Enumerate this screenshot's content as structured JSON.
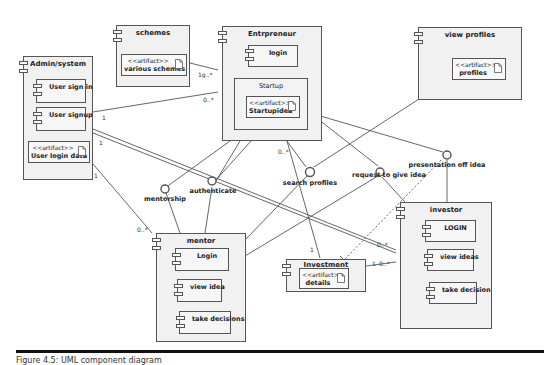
{
  "diagram": {
    "type": "UML component diagram",
    "components": {
      "admin": {
        "title": "Admin/system",
        "children": [
          {
            "kind": "component",
            "label": "User sign in"
          },
          {
            "kind": "component",
            "label": "User signup"
          },
          {
            "kind": "artifact",
            "stereotype": "<<artifact>>",
            "label": "User login data"
          }
        ]
      },
      "schemes": {
        "title": "schemes",
        "children": [
          {
            "kind": "artifact",
            "stereotype": "<<artifact>>",
            "label": "various schemes"
          }
        ]
      },
      "entrepreneur": {
        "title": "Entrpreneur",
        "children": [
          {
            "kind": "component",
            "label": "login"
          },
          {
            "kind": "container",
            "label": "Startup",
            "children": [
              {
                "kind": "artifact",
                "stereotype": "<<artifact>>",
                "label": "Startupidea"
              }
            ]
          }
        ]
      },
      "view_profiles": {
        "title": "view profiles",
        "children": [
          {
            "kind": "artifact",
            "stereotype": "<<artifact>>",
            "label": "profiles"
          }
        ]
      },
      "mentor": {
        "title": "mentor",
        "children": [
          {
            "kind": "component",
            "label": "Login"
          },
          {
            "kind": "component",
            "label": "view idea"
          },
          {
            "kind": "component",
            "label": "take decisions"
          }
        ]
      },
      "investment": {
        "title": "Investment",
        "children": [
          {
            "kind": "artifact",
            "stereotype": "<<artifact>>",
            "label": "details"
          }
        ]
      },
      "investor": {
        "title": "investor",
        "children": [
          {
            "kind": "component",
            "label": "LOGIN"
          },
          {
            "kind": "component",
            "label": "view ideas"
          },
          {
            "kind": "component",
            "label": "take decision"
          }
        ]
      }
    },
    "interfaces": [
      {
        "id": "mentorship",
        "label": "mentorship"
      },
      {
        "id": "authenticate",
        "label": "authenticate"
      },
      {
        "id": "search_profiles",
        "label": "search profiles"
      },
      {
        "id": "request_idea",
        "label": "request to give idea"
      },
      {
        "id": "presentation",
        "label": "presentation off idea"
      }
    ],
    "multiplicities": {
      "schemes_entre": "1g..*",
      "admin_entre_src": "1",
      "admin_entre_dst": "0..*",
      "admin_investor_src": "1",
      "admin_mentor_src": "1",
      "admin_mentor_dst": "0..*",
      "entre_investment_src": "0..*",
      "entre_investment_dst": "1",
      "investor_admin_dst": "0..*",
      "investment_investor_src": "1",
      "investment_investor_dst": "0..*"
    }
  },
  "caption": "Figure 4.5: UML component diagram"
}
